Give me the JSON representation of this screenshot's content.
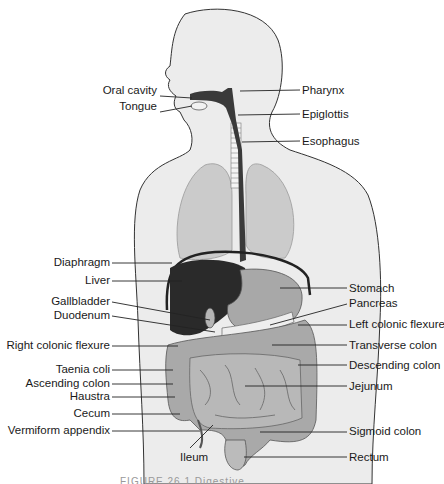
{
  "diagram": {
    "caption": "FIGURE 26.1  Digestive",
    "colors": {
      "body": "#ececec",
      "outline": "#333333",
      "lung": "#c9c9c9",
      "organ": "#a8a8a8",
      "dark": "#2a2a2a",
      "label_line": "#222222"
    },
    "labels_left": [
      {
        "text": "Oral cavity",
        "y": 95
      },
      {
        "text": "Tongue",
        "y": 111
      },
      {
        "text": "Diaphragm",
        "y": 262
      },
      {
        "text": "Liver",
        "y": 280
      },
      {
        "text": "Gallbladder",
        "y": 302
      },
      {
        "text": "Duodenum",
        "y": 316
      },
      {
        "text": "Right colonic flexure",
        "y": 345
      },
      {
        "text": "Taenia coli",
        "y": 369
      },
      {
        "text": "Ascending colon",
        "y": 383
      },
      {
        "text": "Haustra",
        "y": 396
      },
      {
        "text": "Cecum",
        "y": 414
      },
      {
        "text": "Vermiform appendix",
        "y": 430
      }
    ],
    "labels_right": [
      {
        "text": "Pharynx",
        "y": 90
      },
      {
        "text": "Epiglottis",
        "y": 114
      },
      {
        "text": "Esophagus",
        "y": 141
      },
      {
        "text": "Stomach",
        "y": 288
      },
      {
        "text": "Pancreas",
        "y": 304
      },
      {
        "text": "Left colonic flexure",
        "y": 324
      },
      {
        "text": "Transverse colon",
        "y": 345
      },
      {
        "text": "Descending colon",
        "y": 365
      },
      {
        "text": "Jejunum",
        "y": 386
      },
      {
        "text": "Sigmoid colon",
        "y": 431
      },
      {
        "text": "Rectum",
        "y": 457
      }
    ],
    "label_bottom": {
      "text": "Ileum",
      "x": 181,
      "y": 456
    }
  }
}
